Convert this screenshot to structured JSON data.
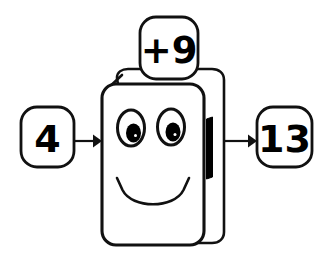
{
  "diagram": {
    "type": "function-machine",
    "background_color": "#ffffff",
    "stroke_color": "#111111",
    "fill_color": "#ffffff",
    "input": {
      "label": "4",
      "box_name": "input-box"
    },
    "operation": {
      "label": "+9",
      "box_name": "operation-box"
    },
    "output": {
      "label": "13",
      "box_name": "output-box"
    },
    "machine": {
      "name": "function-machine-body",
      "face": {
        "expression": "smiling",
        "eyes": 2,
        "mouth": "smile"
      },
      "handle_color": "#000000"
    },
    "arrows": [
      {
        "name": "input-arrow",
        "direction": "right"
      },
      {
        "name": "output-arrow",
        "direction": "right"
      }
    ]
  }
}
